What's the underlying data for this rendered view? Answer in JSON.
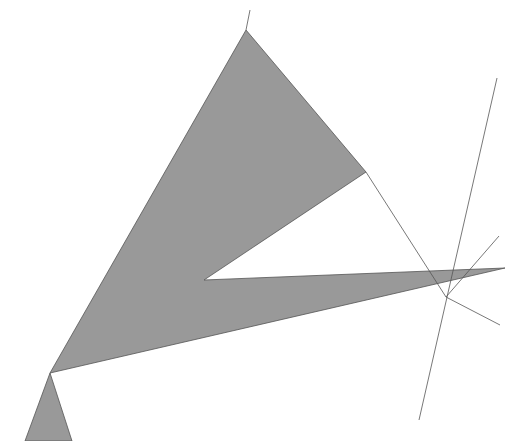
{
  "figure": {
    "title": "Geometric figure: shaded concave polygon with intersecting construction lines",
    "background_color": "#ffffff",
    "fill_color": "#999999",
    "stroke_color": "#555555",
    "stroke_width": 0.8,
    "caption": "",
    "width": 515,
    "height": 441
  },
  "chart_data": {
    "type": "scatter",
    "title": "Geometric figure: shaded concave polygon with intersecting construction lines",
    "xlabel": "",
    "ylabel": "",
    "xlim": [
      0,
      515
    ],
    "ylim": [
      441,
      0
    ],
    "grid": false,
    "legend": "none",
    "shapes": [
      {
        "name": "main-shaded-polygon",
        "kind": "polygon",
        "fill": "#999999",
        "stroke": "#555555",
        "points": [
          [
            246,
            30
          ],
          [
            366,
            172
          ],
          [
            204,
            280
          ],
          [
            505,
            268
          ],
          [
            50,
            373
          ]
        ]
      },
      {
        "name": "small-shaded-triangle",
        "kind": "polygon",
        "fill": "#999999",
        "stroke": "#555555",
        "points": [
          [
            50,
            373
          ],
          [
            72,
            441
          ],
          [
            25,
            441
          ]
        ]
      }
    ],
    "lines": [
      {
        "name": "long-ascending-line",
        "stroke": "#555555",
        "x1": 419,
        "y1": 420,
        "x2": 497,
        "y2": 78
      },
      {
        "name": "apex-extension-line",
        "stroke": "#555555",
        "x1": 246,
        "y1": 30,
        "x2": 250,
        "y2": 10
      },
      {
        "name": "steep-descending-line",
        "stroke": "#555555",
        "x1": 499,
        "y1": 236,
        "x2": 446,
        "y2": 297
      },
      {
        "name": "lower-right-diagonal-line",
        "stroke": "#555555",
        "x1": 446,
        "y1": 297,
        "x2": 500,
        "y2": 325
      },
      {
        "name": "triangle-edge-extension-line",
        "stroke": "#555555",
        "x1": 366,
        "y1": 172,
        "x2": 446,
        "y2": 297
      }
    ],
    "vertices": [
      {
        "name": "apex",
        "x": 246,
        "y": 30
      },
      {
        "name": "right-upper",
        "x": 366,
        "y": 172
      },
      {
        "name": "notch-concave",
        "x": 204,
        "y": 280
      },
      {
        "name": "right-tip",
        "x": 505,
        "y": 268
      },
      {
        "name": "pinch-point",
        "x": 50,
        "y": 373
      },
      {
        "name": "lower-left-base-left",
        "x": 25,
        "y": 441
      },
      {
        "name": "lower-left-base-right",
        "x": 72,
        "y": 441
      }
    ]
  }
}
